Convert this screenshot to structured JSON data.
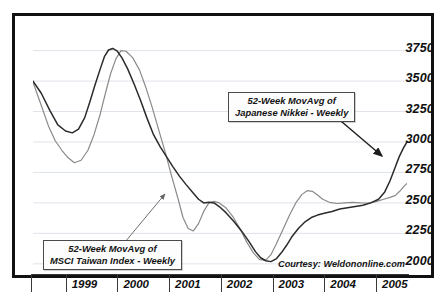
{
  "chart_data": {
    "type": "line",
    "title": "",
    "subtitle": "",
    "xlabel": "",
    "ylabel": "",
    "ylim": [
      1900,
      3870
    ],
    "xlim": [
      1998.62,
      2005.85
    ],
    "grid": true,
    "grid_values": [
      2000,
      2250,
      2500,
      2750,
      3000,
      3250,
      3500,
      3750
    ],
    "ytick_labels": [
      "3750",
      "3500",
      "3250",
      "3000",
      "2750",
      "2500",
      "2250",
      "2000"
    ],
    "ytick_values": [
      3750,
      3500,
      3250,
      3000,
      2750,
      2500,
      2250,
      2000
    ],
    "xtick_labels": [
      "1999",
      "2000",
      "2001",
      "2002",
      "2003",
      "2004",
      "2005"
    ],
    "xtick_values": [
      1999,
      2000,
      2001,
      2002,
      2003,
      2004,
      2005
    ],
    "legend_position": "annotations-in-plot",
    "series": [
      {
        "name": "52-Week MovAvg of Japanese Nikkei - Weekly",
        "short_name": "Japanese Nikkei",
        "color": "#2b2b2b",
        "width": 1.5,
        "x": [
          1998.62,
          1998.78,
          1998.95,
          1999.1,
          1999.25,
          1999.38,
          1999.5,
          1999.62,
          1999.72,
          1999.82,
          1999.92,
          2000.0,
          2000.08,
          2000.16,
          2000.25,
          2000.34,
          2000.45,
          2000.58,
          2000.7,
          2000.82,
          2000.95,
          2001.08,
          2001.2,
          2001.32,
          2001.45,
          2001.58,
          2001.7,
          2001.82,
          2001.92,
          2002.02,
          2002.12,
          2002.22,
          2002.35,
          2002.5,
          2002.65,
          2002.8,
          2002.92,
          2003.02,
          2003.12,
          2003.22,
          2003.32,
          2003.42,
          2003.52,
          2003.62,
          2003.75,
          2003.88,
          2004.0,
          2004.12,
          2004.25,
          2004.4,
          2004.55,
          2004.7,
          2004.85,
          2005.0,
          2005.15,
          2005.3,
          2005.42,
          2005.52,
          2005.62,
          2005.7,
          2005.78,
          2005.85
        ],
        "y": [
          3500,
          3400,
          3255,
          3140,
          3090,
          3075,
          3105,
          3200,
          3330,
          3470,
          3600,
          3700,
          3755,
          3768,
          3745,
          3690,
          3600,
          3470,
          3340,
          3200,
          3060,
          2960,
          2880,
          2800,
          2720,
          2650,
          2590,
          2530,
          2500,
          2505,
          2500,
          2470,
          2420,
          2350,
          2270,
          2180,
          2100,
          2050,
          2025,
          2018,
          2040,
          2090,
          2150,
          2220,
          2290,
          2345,
          2380,
          2400,
          2415,
          2430,
          2450,
          2460,
          2470,
          2480,
          2500,
          2530,
          2590,
          2680,
          2790,
          2880,
          2950,
          3000
        ]
      },
      {
        "name": "52-Week MovAvg of MSCI Taiwan Index - Weekly",
        "short_name": "MSCI Taiwan Index",
        "color": "#8a8a8a",
        "width": 1.2,
        "x": [
          1998.62,
          1998.78,
          1998.92,
          1999.05,
          1999.18,
          1999.3,
          1999.42,
          1999.55,
          1999.68,
          1999.8,
          1999.92,
          2000.02,
          2000.12,
          2000.22,
          2000.32,
          2000.42,
          2000.55,
          2000.68,
          2000.8,
          2000.92,
          2001.05,
          2001.18,
          2001.3,
          2001.42,
          2001.52,
          2001.62,
          2001.72,
          2001.82,
          2001.92,
          2002.02,
          2002.12,
          2002.22,
          2002.35,
          2002.48,
          2002.62,
          2002.75,
          2002.88,
          2003.0,
          2003.12,
          2003.22,
          2003.32,
          2003.45,
          2003.58,
          2003.7,
          2003.82,
          2003.92,
          2004.02,
          2004.12,
          2004.22,
          2004.35,
          2004.5,
          2004.65,
          2004.8,
          2004.95,
          2005.1,
          2005.25,
          2005.4,
          2005.52,
          2005.62,
          2005.72,
          2005.8,
          2005.85
        ],
        "y": [
          3490,
          3300,
          3130,
          3010,
          2930,
          2870,
          2830,
          2850,
          2930,
          3060,
          3230,
          3400,
          3560,
          3680,
          3750,
          3745,
          3690,
          3590,
          3450,
          3290,
          3100,
          2910,
          2720,
          2540,
          2380,
          2290,
          2270,
          2330,
          2430,
          2500,
          2512,
          2500,
          2460,
          2390,
          2290,
          2180,
          2090,
          2035,
          2030,
          2075,
          2160,
          2280,
          2400,
          2500,
          2570,
          2600,
          2595,
          2565,
          2530,
          2505,
          2495,
          2500,
          2505,
          2500,
          2498,
          2510,
          2530,
          2545,
          2560,
          2600,
          2640,
          2660
        ]
      }
    ],
    "annotations": [
      {
        "id": "nikkei",
        "lines": [
          "52-Week MovAvg of",
          "Japanese Nikkei - Weekly"
        ],
        "arrow_from": [
          320,
          100
        ],
        "arrow_to": [
          367,
          140
        ]
      },
      {
        "id": "taiwan",
        "lines": [
          "52-Week MovAvg of",
          "MSCI Taiwan Index - Weekly"
        ],
        "arrow_from": [
          110,
          226
        ],
        "arrow_to": [
          150,
          178
        ]
      }
    ],
    "credit": "Courtesy: Weldononline.com"
  },
  "axis": {
    "y_labels": [
      "3750",
      "3500",
      "3250",
      "3000",
      "2750",
      "2500",
      "2250",
      "2000"
    ],
    "x_labels": [
      "1999",
      "2000",
      "2001",
      "2002",
      "2003",
      "2004",
      "2005"
    ]
  },
  "annotations": {
    "nikkei": {
      "line1": "52-Week MovAvg of",
      "line2": "Japanese Nikkei - Weekly"
    },
    "taiwan": {
      "line1": "52-Week MovAvg of",
      "line2": "MSCI Taiwan Index - Weekly"
    }
  },
  "credit": {
    "text": "Courtesy: Weldononline.com"
  }
}
